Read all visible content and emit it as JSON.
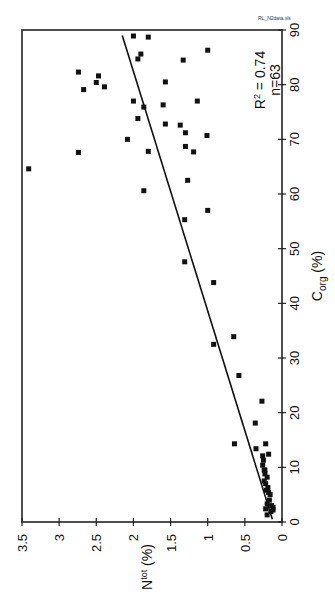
{
  "file_label": "RL_N2data.xls",
  "stats": {
    "r2": "R² = 0.74",
    "n": "n=63"
  },
  "chart_data": {
    "type": "scatter",
    "title": "",
    "orientation": "rotated 90 degrees clockwise (x-axis on right side, y-axis at bottom)",
    "xlabel": "C_org (%)",
    "ylabel": "N_tot (%)",
    "xlim": [
      0,
      90
    ],
    "ylim": [
      0,
      3.5
    ],
    "x_ticks": [
      0,
      10,
      20,
      30,
      40,
      50,
      60,
      70,
      80,
      90
    ],
    "y_ticks": [
      "0",
      "0.5",
      "1",
      "1.5",
      "2",
      "2.5",
      "3",
      "3.5"
    ],
    "grid": false,
    "legend": null,
    "annotations": [
      "R² = 0.74",
      "n=63",
      "RL_N2data.xls"
    ],
    "regression_line": {
      "x": [
        0.5,
        89
      ],
      "y": [
        0.13,
        2.15
      ]
    },
    "series": [
      {
        "name": "samples",
        "points": [
          [
            88.9,
            2.0
          ],
          [
            88.7,
            1.8
          ],
          [
            85.6,
            1.9
          ],
          [
            84.7,
            1.94
          ],
          [
            82.3,
            2.74
          ],
          [
            81.6,
            2.47
          ],
          [
            80.4,
            2.5
          ],
          [
            79.1,
            2.67
          ],
          [
            79.6,
            2.39
          ],
          [
            77.0,
            2.0
          ],
          [
            75.9,
            1.86
          ],
          [
            73.8,
            1.94
          ],
          [
            70.0,
            2.08
          ],
          [
            67.6,
            2.74
          ],
          [
            67.8,
            1.8
          ],
          [
            86.3,
            1.0
          ],
          [
            84.5,
            1.33
          ],
          [
            80.5,
            1.57
          ],
          [
            76.3,
            1.6
          ],
          [
            77.0,
            1.14
          ],
          [
            72.6,
            1.37
          ],
          [
            72.8,
            1.57
          ],
          [
            70.7,
            1.01
          ],
          [
            71.2,
            1.3
          ],
          [
            68.7,
            1.3
          ],
          [
            67.7,
            1.19
          ],
          [
            64.6,
            3.41
          ],
          [
            62.5,
            1.27
          ],
          [
            60.6,
            1.86
          ],
          [
            57.0,
            1.0
          ],
          [
            55.3,
            1.31
          ],
          [
            47.6,
            1.31
          ],
          [
            43.8,
            0.92
          ],
          [
            33.9,
            0.65
          ],
          [
            32.5,
            0.92
          ],
          [
            26.8,
            0.58
          ],
          [
            22.1,
            0.27
          ],
          [
            18.1,
            0.36
          ],
          [
            14.3,
            0.64
          ],
          [
            14.3,
            0.22
          ],
          [
            13.4,
            0.35
          ],
          [
            12.1,
            0.26
          ],
          [
            12.4,
            0.18
          ],
          [
            11.3,
            0.25
          ],
          [
            10.4,
            0.26
          ],
          [
            9.5,
            0.24
          ],
          [
            9.5,
            0.23
          ],
          [
            8.8,
            0.23
          ],
          [
            8.2,
            0.2
          ],
          [
            7.5,
            0.24
          ],
          [
            7.0,
            0.22
          ],
          [
            5.8,
            0.21
          ],
          [
            5.4,
            0.18
          ],
          [
            5.0,
            0.16
          ],
          [
            3.3,
            0.2
          ],
          [
            2.4,
            0.22
          ],
          [
            2.2,
            0.12
          ],
          [
            2.7,
            0.12
          ],
          [
            1.9,
            0.15
          ],
          [
            1.3,
            0.2
          ],
          [
            3.0,
            0.14
          ],
          [
            4.0,
            0.17
          ],
          [
            6.3,
            0.19
          ]
        ]
      }
    ]
  }
}
